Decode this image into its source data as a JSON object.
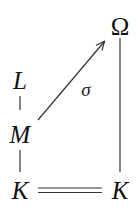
{
  "diagram": {
    "nodes": {
      "omega": "Ω",
      "L": "L",
      "M": "M",
      "K_left": "K",
      "K_right": "K"
    },
    "edges": [
      {
        "from": "L",
        "to": "M",
        "style": "line"
      },
      {
        "from": "M",
        "to": "K_left",
        "style": "line"
      },
      {
        "from": "M",
        "to": "omega",
        "style": "arrow",
        "label": "σ"
      },
      {
        "from": "omega",
        "to": "K_right",
        "style": "line"
      },
      {
        "from": "K_left",
        "to": "K_right",
        "style": "double-line"
      }
    ],
    "labels": {
      "sigma": "σ"
    },
    "colors": {
      "ink": "#111111",
      "background": "#ffffff"
    }
  }
}
